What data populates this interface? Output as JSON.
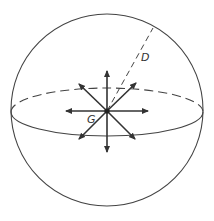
{
  "diagram": {
    "type": "sphere-with-radiating-arrows",
    "labels": {
      "center": "G",
      "radius": "D"
    },
    "colors": {
      "stroke": "#444444",
      "arrow": "#333333",
      "background": "#ffffff"
    },
    "sphere": {
      "cx": 107,
      "cy": 110,
      "r": 96
    },
    "equator": {
      "cx": 107,
      "cy": 112,
      "rx": 96,
      "ry": 24
    },
    "arrow_count": 8
  }
}
